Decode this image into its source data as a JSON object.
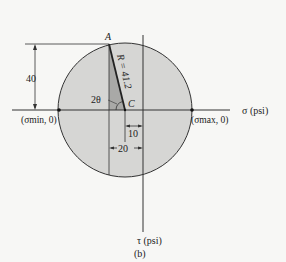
{
  "figure": {
    "caption": "(b)",
    "type": "Mohr's circle",
    "colors": {
      "circle_fill": "#d6d6d4",
      "wedge_fill": "#a9a9a7",
      "line": "#333333",
      "background": "#f7f7f5"
    }
  },
  "axes": {
    "sigma_label": "σ (psi)",
    "tau_label": "τ (psi)"
  },
  "points": {
    "A": "A",
    "C": "C",
    "sigma_min": "(σmin, 0)",
    "sigma_max": "(σmax, 0)"
  },
  "labels": {
    "radius": "R = 41.2",
    "angle": "2θ",
    "dim_vertical": "40",
    "dim_center_offset": "10",
    "dim_horizontal": "20"
  }
}
